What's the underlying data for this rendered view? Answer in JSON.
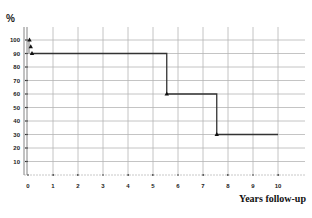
{
  "chart_data": {
    "type": "line",
    "subtype": "step",
    "title": "",
    "ylabel": "%",
    "xlabel": "Years follow-up",
    "xlim": [
      0,
      10
    ],
    "ylim": [
      0,
      100
    ],
    "x_ticks": [
      0,
      1,
      2,
      3,
      4,
      5,
      6,
      7,
      8,
      9,
      10
    ],
    "y_ticks": [
      10,
      20,
      30,
      40,
      50,
      60,
      70,
      80,
      90,
      100
    ],
    "grid": true,
    "legend": null,
    "series": [
      {
        "name": "Survival",
        "color": "#333333",
        "marker": "triangle",
        "step_points": [
          {
            "x": 0,
            "y": 100
          },
          {
            "x": 0.05,
            "y": 95
          },
          {
            "x": 0.1,
            "y": 90
          },
          {
            "x": 5.55,
            "y": 60
          },
          {
            "x": 7.55,
            "y": 30
          },
          {
            "x": 10,
            "y": 30
          }
        ]
      }
    ]
  },
  "labels": {
    "unit": "%",
    "x_title": "Years follow-up"
  }
}
